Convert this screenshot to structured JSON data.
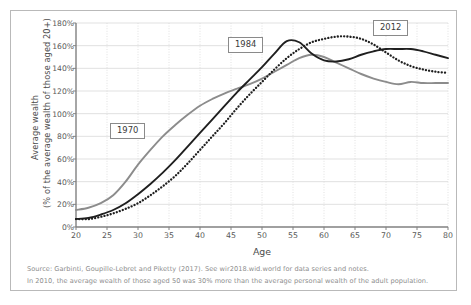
{
  "chart_data": {
    "type": "line",
    "title": "",
    "xlabel": "Age",
    "ylabel": "Average wealth (% of the average wealth of those aged 20+)",
    "ylabel_line1": "Average wealth",
    "ylabel_line2": "(% of the average wealth of those aged 20+)",
    "xlim": [
      20,
      80
    ],
    "ylim": [
      0,
      180
    ],
    "grid": true,
    "legend_position": "inline-annotations",
    "xticks": [
      20,
      25,
      30,
      35,
      40,
      45,
      50,
      55,
      60,
      65,
      70,
      75,
      80
    ],
    "xtick_labels": [
      "20",
      "25",
      "30",
      "35",
      "40",
      "45",
      "50",
      "55",
      "60",
      "65",
      "70",
      "75",
      "80"
    ],
    "yticks": [
      0,
      20,
      40,
      60,
      80,
      100,
      120,
      140,
      160,
      180
    ],
    "ytick_labels": [
      "0%",
      "20%",
      "40%",
      "60%",
      "80%",
      "100%",
      "120%",
      "140%",
      "160%",
      "180%"
    ],
    "x": [
      20,
      22,
      24,
      26,
      28,
      30,
      32,
      34,
      36,
      38,
      40,
      42,
      44,
      46,
      48,
      50,
      52,
      54,
      56,
      58,
      60,
      62,
      64,
      66,
      68,
      70,
      72,
      74,
      76,
      78,
      80
    ],
    "series": [
      {
        "name": "1970",
        "color": "#8c8c8c",
        "style": "solid",
        "annotation": "1970",
        "values": [
          15,
          17,
          21,
          28,
          40,
          55,
          68,
          80,
          90,
          99,
          107,
          113,
          118,
          122,
          126,
          131,
          137,
          143,
          149,
          152,
          150,
          145,
          140,
          135,
          131,
          128,
          126,
          128,
          127,
          127,
          127
        ]
      },
      {
        "name": "1984",
        "color": "#1f1f1f",
        "style": "solid",
        "annotation": "1984",
        "values": [
          7,
          8,
          11,
          15,
          21,
          29,
          38,
          48,
          59,
          71,
          83,
          95,
          107,
          119,
          130,
          141,
          153,
          164,
          163,
          153,
          147,
          146,
          148,
          152,
          155,
          157,
          157,
          157,
          155,
          152,
          149
        ]
      },
      {
        "name": "2012",
        "color": "#1f1f1f",
        "style": "dotted",
        "annotation": "2012",
        "values": [
          7,
          7,
          9,
          12,
          16,
          21,
          28,
          36,
          45,
          56,
          68,
          80,
          92,
          105,
          117,
          128,
          139,
          149,
          157,
          163,
          166,
          168,
          168,
          166,
          161,
          154,
          147,
          142,
          139,
          137,
          136
        ]
      }
    ],
    "annotations": [
      {
        "text": "1970",
        "x": 30,
        "y": 82
      },
      {
        "text": "1984",
        "x": 49,
        "y": 163
      },
      {
        "text": "2012",
        "x": 71,
        "y": 177
      }
    ],
    "notes": [
      "Source: Garbinti, Goupille-Lebret and Piketty (2017). See wir2018.wid.world for data series and notes.",
      "In 2010, the average wealth of those aged 50 was 30% more than the average personal wealth of the adult population."
    ],
    "colors": {
      "grid": "#d9d9d9",
      "axis": "#808080",
      "text": "#585858",
      "note_text": "#8d8d8d",
      "border": "#b9b9b9"
    }
  }
}
